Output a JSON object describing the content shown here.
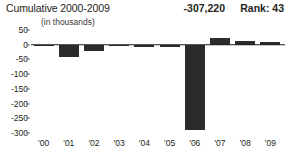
{
  "header": {
    "title": "Cumulative 2000-2009",
    "subtitle": "(in thousands)",
    "value": "-307,220",
    "rank": "Rank: 43"
  },
  "chart_data": {
    "type": "bar",
    "title": "Cumulative 2000-2009",
    "subtitle": "(in thousands)",
    "xlabel": "",
    "ylabel": "",
    "ylim": [
      -300,
      50
    ],
    "yticks": [
      50,
      0,
      -50,
      -100,
      -150,
      -200,
      -250,
      -300
    ],
    "ytick_labels": [
      "50",
      "0",
      "-50",
      "-100",
      "-150",
      "-200",
      "-250",
      "-300"
    ],
    "grid": false,
    "legend": null,
    "bar_color": "#2b2b2b",
    "zero_line_color": "#231f20",
    "categories": [
      "'00",
      "'01",
      "'02",
      "'03",
      "'04",
      "'05",
      "'06",
      "'07",
      "'08",
      "'09"
    ],
    "values": [
      -4,
      -42,
      -21,
      -6,
      -7,
      -9,
      -290,
      22,
      11,
      10
    ],
    "annotations": [
      {
        "label": "total",
        "text": "-307,220"
      },
      {
        "label": "rank",
        "text": "Rank: 43"
      }
    ]
  }
}
